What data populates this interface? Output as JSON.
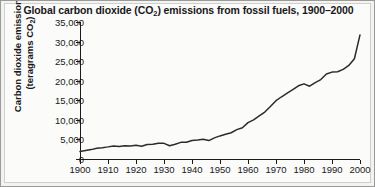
{
  "figure": {
    "title_prefix": "Global carbon dioxide (CO",
    "title_sub": "2",
    "title_suffix": ") emissions from fossil fuels, 1900–2000",
    "background_color": "#f3f3f1",
    "plot_background_color": "#fbfbfa",
    "line_color": "#2b2b2b",
    "axis_color": "#1a1a1a",
    "text_color": "#18181a"
  },
  "axes": {
    "y_title_line1": "Carbon dioxide emissions",
    "y_title_line2_prefix": "(teragrams CO",
    "y_title_line2_sub": "2",
    "y_title_line2_suffix": ")",
    "y_ticks": [
      "0",
      "5,000",
      "10,000",
      "15,000",
      "20,000",
      "25,000",
      "30,000",
      "35,000"
    ],
    "x_ticks": [
      "1900",
      "1910",
      "1920",
      "1930",
      "1940",
      "1950",
      "1960",
      "1970",
      "1980",
      "1990",
      "2000"
    ]
  },
  "chart_data": {
    "type": "line",
    "title": "Global carbon dioxide (CO2) emissions from fossil fuels, 1900–2000",
    "xlabel": "",
    "ylabel": "Carbon dioxide emissions (teragrams CO2)",
    "xlim": [
      1900,
      2000
    ],
    "ylim": [
      0,
      35000
    ],
    "xtick_values": [
      1900,
      1910,
      1920,
      1930,
      1940,
      1950,
      1960,
      1970,
      1980,
      1990,
      2000
    ],
    "ytick_values": [
      0,
      5000,
      10000,
      15000,
      20000,
      25000,
      30000,
      35000
    ],
    "grid": false,
    "legend": null,
    "series": [
      {
        "name": "Global CO2 emissions from fossil fuels",
        "units": "teragrams CO2",
        "x": [
          1900,
          1902,
          1904,
          1906,
          1908,
          1910,
          1912,
          1914,
          1916,
          1918,
          1920,
          1922,
          1924,
          1926,
          1928,
          1930,
          1932,
          1934,
          1936,
          1938,
          1940,
          1942,
          1944,
          1946,
          1948,
          1950,
          1952,
          1954,
          1956,
          1958,
          1960,
          1962,
          1964,
          1966,
          1968,
          1970,
          1972,
          1974,
          1976,
          1978,
          1980,
          1982,
          1984,
          1986,
          1988,
          1990,
          1992,
          1994,
          1996,
          1998,
          2000
        ],
        "y": [
          1900,
          2150,
          2400,
          2750,
          2900,
          3100,
          3350,
          3200,
          3400,
          3300,
          3500,
          3250,
          3700,
          3750,
          4050,
          4000,
          3400,
          3750,
          4250,
          4300,
          4750,
          4850,
          5050,
          4700,
          5400,
          5900,
          6300,
          6700,
          7500,
          8000,
          9300,
          10000,
          11000,
          12000,
          13400,
          14900,
          15900,
          16800,
          17700,
          18700,
          19200,
          18600,
          19500,
          20300,
          21700,
          22200,
          22300,
          22900,
          23900,
          25600,
          31700
        ]
      }
    ],
    "annotations": []
  }
}
